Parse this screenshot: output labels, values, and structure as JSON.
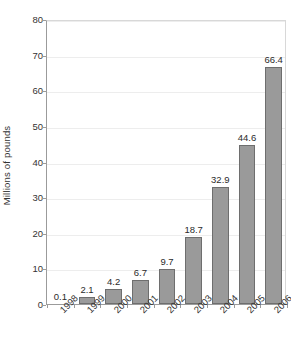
{
  "chart_data": {
    "type": "bar",
    "title": "",
    "subtitle": "",
    "xlabel": "",
    "ylabel": "Millions of pounds",
    "categories": [
      "1998",
      "1999",
      "2000",
      "2001",
      "2002",
      "2003",
      "2004",
      "2005",
      "2006"
    ],
    "values": [
      0.1,
      2.1,
      4.2,
      6.7,
      9.7,
      18.7,
      32.9,
      44.6,
      66.4
    ],
    "value_labels": [
      "0.1",
      "2.1",
      "4.2",
      "6.7",
      "9.7",
      "18.7",
      "32.9",
      "44.6",
      "66.4"
    ],
    "ylim": [
      0,
      80
    ],
    "y_ticks": [
      0,
      10,
      20,
      30,
      40,
      50,
      60,
      70,
      80
    ],
    "y_tick_labels": [
      "0",
      "10",
      "20",
      "30",
      "40",
      "50",
      "60",
      "70",
      "80"
    ],
    "grid": true,
    "grid_axis": "y",
    "legend": false,
    "legend_position": "none",
    "bar_fill_color": "#9a9a9a",
    "bar_border_color": "#6e6e6e",
    "gridline_color": "#ededed",
    "axis_color": "#9b9b9b",
    "text_color": "#333333",
    "background_color": "#ffffff",
    "x_tick_label_rotation": -45
  }
}
